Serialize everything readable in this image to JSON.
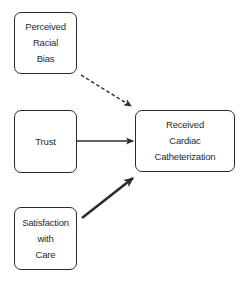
{
  "diagram": {
    "type": "path-diagram",
    "nodes": [
      {
        "id": "perceived-racial-bias",
        "lines": [
          "Perceived",
          "Racial",
          "Bias"
        ]
      },
      {
        "id": "trust",
        "lines": [
          "Trust"
        ]
      },
      {
        "id": "satisfaction-with-care",
        "lines": [
          "Satisfaction",
          "with",
          "Care"
        ]
      },
      {
        "id": "received-cardiac-catheterization",
        "lines": [
          "Received",
          "Cardiac",
          "Catheterization"
        ]
      }
    ],
    "edges": [
      {
        "from": "perceived-racial-bias",
        "to": "received-cardiac-catheterization",
        "style": "dashed",
        "weight": "normal"
      },
      {
        "from": "trust",
        "to": "received-cardiac-catheterization",
        "style": "solid",
        "weight": "normal"
      },
      {
        "from": "satisfaction-with-care",
        "to": "received-cardiac-catheterization",
        "style": "solid",
        "weight": "thick"
      }
    ],
    "colors": {
      "stroke": "#2b2b2b",
      "background": "#ffffff"
    }
  }
}
